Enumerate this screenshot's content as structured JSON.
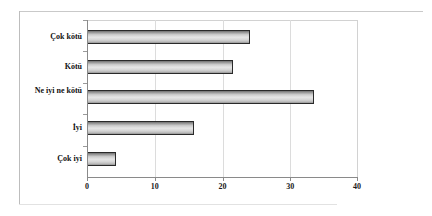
{
  "chart_data": {
    "type": "bar",
    "orientation": "horizontal",
    "title": "",
    "subtitle": "",
    "xlabel": "",
    "ylabel": "",
    "categories": [
      "Çok kötü",
      "Kötü",
      "Ne iyi ne kötü",
      "İyi",
      "Çok iyi"
    ],
    "values": [
      24,
      21.5,
      33.5,
      15.8,
      4.3
    ],
    "series": [
      {
        "name": "",
        "values": [
          24,
          21.5,
          33.5,
          15.8,
          4.3
        ]
      }
    ],
    "xlim": [
      0,
      40
    ],
    "ylim": [
      0,
      5
    ],
    "xticks": [
      0,
      10,
      20,
      30,
      40
    ],
    "xtick_labels": [
      "0",
      "10",
      "20",
      "30",
      "40"
    ],
    "grid": "vertical",
    "legend": "none",
    "bar_fill": "#d9d9d9",
    "bar_edge": "#2a2a2a",
    "axis_color": "#8a8a8a",
    "grid_color": "#dcdcdc",
    "annotations": []
  }
}
